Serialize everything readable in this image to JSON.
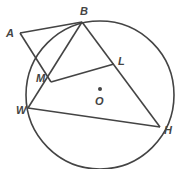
{
  "diagram": {
    "circle": {
      "center": "O",
      "cx": 100,
      "cy": 95,
      "r": 74
    },
    "points": {
      "A": {
        "label": "A",
        "x": 20,
        "y": 33
      },
      "B": {
        "label": "B",
        "x": 82,
        "y": 22
      },
      "L": {
        "label": "L",
        "x": 115,
        "y": 63
      },
      "M": {
        "label": "M",
        "x": 51,
        "y": 82
      },
      "W": {
        "label": "W",
        "x": 28,
        "y": 108
      },
      "H": {
        "label": "H",
        "x": 160,
        "y": 127
      },
      "O": {
        "label": "O",
        "x": 100,
        "y": 89
      }
    },
    "segments": [
      "AB",
      "AM",
      "BW",
      "BH",
      "WH",
      "ML"
    ]
  }
}
